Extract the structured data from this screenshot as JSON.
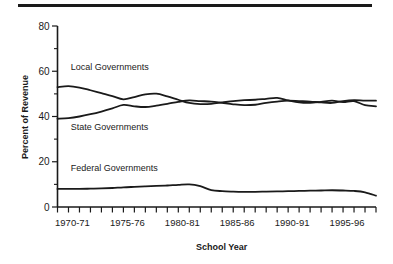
{
  "decoration": {
    "top_rule": "horizontal-rule"
  },
  "chart_data": {
    "type": "line",
    "title": "",
    "xlabel": "School Year",
    "ylabel": "Percent of Revenue",
    "ylim": [
      0,
      80
    ],
    "grid": false,
    "legend_position": "inline-labels",
    "y_major_ticks": [
      "0",
      "20",
      "40",
      "60",
      "80"
    ],
    "y_minor_ticks": [
      10,
      30,
      50,
      70
    ],
    "x_tick_labels": [
      "1970-71",
      "1975-76",
      "1980-81",
      "1985-86",
      "1990-91",
      "1995-96"
    ],
    "x_tick_label_years": [
      1970,
      1975,
      1980,
      1985,
      1990,
      1995
    ],
    "x_axis_start_year": 1969,
    "x_axis_end_year": 1998,
    "x": [
      1969,
      1970,
      1971,
      1972,
      1973,
      1974,
      1975,
      1976,
      1977,
      1978,
      1979,
      1980,
      1981,
      1982,
      1983,
      1984,
      1985,
      1986,
      1987,
      1988,
      1989,
      1990,
      1991,
      1992,
      1993,
      1994,
      1995,
      1996,
      1997,
      1998
    ],
    "series": [
      {
        "name": "Local Governments",
        "label": "Local Governments",
        "values": [
          53.0,
          53.4,
          52.8,
          51.6,
          50.3,
          49.0,
          47.6,
          48.6,
          49.8,
          50.1,
          48.9,
          47.4,
          46.0,
          45.5,
          45.6,
          46.2,
          46.8,
          47.2,
          47.4,
          47.8,
          48.2,
          47.1,
          46.2,
          46.0,
          46.5,
          47.0,
          46.4,
          46.8,
          45.0,
          44.5
        ]
      },
      {
        "name": "State Governments",
        "label": "State Governments",
        "values": [
          39.0,
          39.3,
          40.0,
          41.0,
          42.2,
          43.6,
          45.1,
          44.5,
          44.2,
          44.8,
          45.6,
          46.5,
          47.1,
          46.8,
          46.6,
          46.0,
          45.4,
          45.0,
          45.2,
          46.0,
          46.6,
          47.0,
          46.8,
          46.6,
          46.2,
          46.0,
          46.8,
          47.2,
          47.0,
          47.0
        ]
      },
      {
        "name": "Federal Governments",
        "label": "Federal Governments",
        "values": [
          8.0,
          8.0,
          8.0,
          8.1,
          8.2,
          8.4,
          8.7,
          8.9,
          9.1,
          9.3,
          9.5,
          9.8,
          10.0,
          9.2,
          7.5,
          7.0,
          6.8,
          6.7,
          6.7,
          6.8,
          6.9,
          7.0,
          7.1,
          7.2,
          7.3,
          7.4,
          7.3,
          7.1,
          6.5,
          5.0
        ]
      }
    ],
    "series_label_positions": [
      {
        "series": "Local Governments",
        "x": 1970.2,
        "y": 60.5
      },
      {
        "series": "State Governments",
        "x": 1970.2,
        "y": 34.0
      },
      {
        "series": "Federal Governments",
        "x": 1970.2,
        "y": 16.0
      }
    ]
  }
}
